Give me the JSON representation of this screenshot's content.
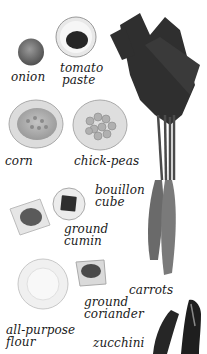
{
  "ingredients": [
    {
      "id": "onion",
      "label": "onion"
    },
    {
      "id": "tomato-paste",
      "line1": "tomato",
      "line2": "paste"
    },
    {
      "id": "corn",
      "label": "corn"
    },
    {
      "id": "chick-peas",
      "label": "chick-peas"
    },
    {
      "id": "bouillon-cube",
      "line1": "bouillon",
      "line2": "cube"
    },
    {
      "id": "ground-cumin",
      "line1": "ground",
      "line2": "cumin"
    },
    {
      "id": "carrots",
      "label": "carrots"
    },
    {
      "id": "ground-coriander",
      "line1": "ground",
      "line2": "coriander"
    },
    {
      "id": "all-purpose-flour",
      "line1": "all-purpose",
      "line2": "flour"
    },
    {
      "id": "zucchini",
      "label": "zucchini"
    }
  ],
  "colors": {
    "background": "#ffffff",
    "text": "#1a1a1a",
    "dark": "#2a2a2a",
    "mid": "#7a7a7a",
    "light": "#d8d8d8"
  }
}
